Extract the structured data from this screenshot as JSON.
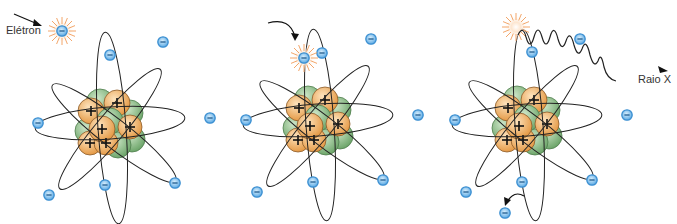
{
  "labels": {
    "electron": "Elétron",
    "xray": "Raio X"
  },
  "symbols": {
    "electron": "−",
    "proton": "+"
  },
  "colors": {
    "electron_fill": "#6fb6e8",
    "electron_stroke": "#3b8fd1",
    "proton_fill": "#f2b872",
    "proton_stroke": "#8a5a2a",
    "neutron_fill": "#8cc08a",
    "neutron_stroke": "#4f7d4d",
    "orbit": "#222222",
    "burst": "#f3a66a"
  },
  "panels": [
    {
      "id": "incoming-electron",
      "nucleus": [
        110,
        125
      ]
    },
    {
      "id": "electron-collision",
      "nucleus": [
        318,
        122
      ]
    },
    {
      "id": "xray-emission",
      "nucleus": [
        527,
        122
      ]
    }
  ]
}
